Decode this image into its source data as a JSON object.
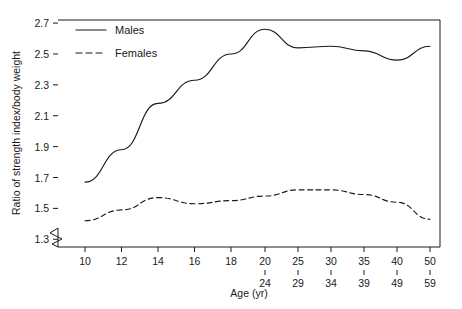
{
  "chart_data": {
    "type": "line",
    "title": "",
    "xlabel": "Age (yr)",
    "ylabel": "Ratio of strength index/body weight",
    "xlim": [
      9,
      51
    ],
    "ylim": [
      1.25,
      2.72
    ],
    "grid": false,
    "legend_position": "top-left inside plot",
    "y_axis_break": true,
    "ytick_labels": [
      "1.3",
      "1.5",
      "1.7",
      "1.9",
      "2.1",
      "2.3",
      "2.5",
      "2.7"
    ],
    "ytick_values": [
      1.3,
      1.5,
      1.7,
      1.9,
      2.1,
      2.3,
      2.5,
      2.7
    ],
    "xtick_labels_primary": [
      "10",
      "12",
      "14",
      "16",
      "18",
      "20",
      "25",
      "30",
      "35",
      "40",
      "50"
    ],
    "xtick_labels_secondary": [
      "",
      "",
      "",
      "",
      "",
      "24",
      "29",
      "34",
      "39",
      "49",
      "59"
    ],
    "x_positions": [
      10,
      12,
      14,
      16,
      18,
      20,
      25,
      30,
      35,
      40,
      50
    ],
    "categories": [
      "10",
      "12",
      "14",
      "16",
      "18",
      "20-24",
      "25-29",
      "30-34",
      "35-39",
      "40-49",
      "50-59"
    ],
    "series": [
      {
        "name": "Males",
        "style": "solid",
        "color": "#1a1a1a",
        "values": [
          1.67,
          1.88,
          2.18,
          2.33,
          2.5,
          2.66,
          2.54,
          2.55,
          2.52,
          2.46,
          2.55
        ]
      },
      {
        "name": "Females",
        "style": "dashed",
        "color": "#1a1a1a",
        "values": [
          1.42,
          1.49,
          1.57,
          1.53,
          1.55,
          1.58,
          1.62,
          1.62,
          1.59,
          1.54,
          1.43
        ]
      }
    ],
    "legend": [
      {
        "label": "Males",
        "style": "solid"
      },
      {
        "label": "Females",
        "style": "dashed"
      }
    ]
  }
}
